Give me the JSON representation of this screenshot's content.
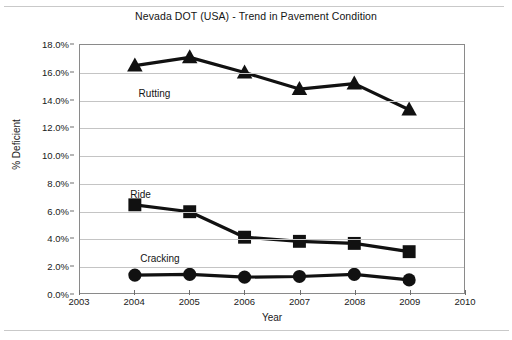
{
  "chart_data": {
    "type": "line",
    "title": "Nevada DOT (USA) - Trend in Pavement Condition",
    "xlabel": "Year",
    "ylabel": "% Deficient",
    "x": [
      2004,
      2005,
      2006,
      2007,
      2008,
      2009
    ],
    "xlim": [
      2003,
      2010
    ],
    "ylim": [
      0.0,
      18.0
    ],
    "xticks": [
      "2003",
      "2004",
      "2005",
      "2006",
      "2007",
      "2008",
      "2009",
      "2010"
    ],
    "yticks": [
      "0.0%",
      "2.0%",
      "4.0%",
      "6.0%",
      "8.0%",
      "10.0%",
      "12.0%",
      "14.0%",
      "16.0%",
      "18.0%"
    ],
    "grid": "horizontal",
    "legend_position": "inline-labels",
    "series": [
      {
        "name": "Rutting",
        "marker": "triangle",
        "color": "#111111",
        "values": [
          16.5,
          17.1,
          16.0,
          14.8,
          15.2,
          13.3
        ],
        "label_x": 2004.35,
        "label_y": 14.55
      },
      {
        "name": "Ride",
        "marker": "square",
        "color": "#111111",
        "values": [
          6.4,
          5.9,
          4.05,
          3.75,
          3.6,
          3.0
        ],
        "label_x": 2004.1,
        "label_y": 7.25
      },
      {
        "name": "Cracking",
        "marker": "circle",
        "color": "#111111",
        "values": [
          1.3,
          1.35,
          1.15,
          1.2,
          1.35,
          0.95
        ],
        "label_x": 2004.45,
        "label_y": 2.65
      }
    ]
  }
}
